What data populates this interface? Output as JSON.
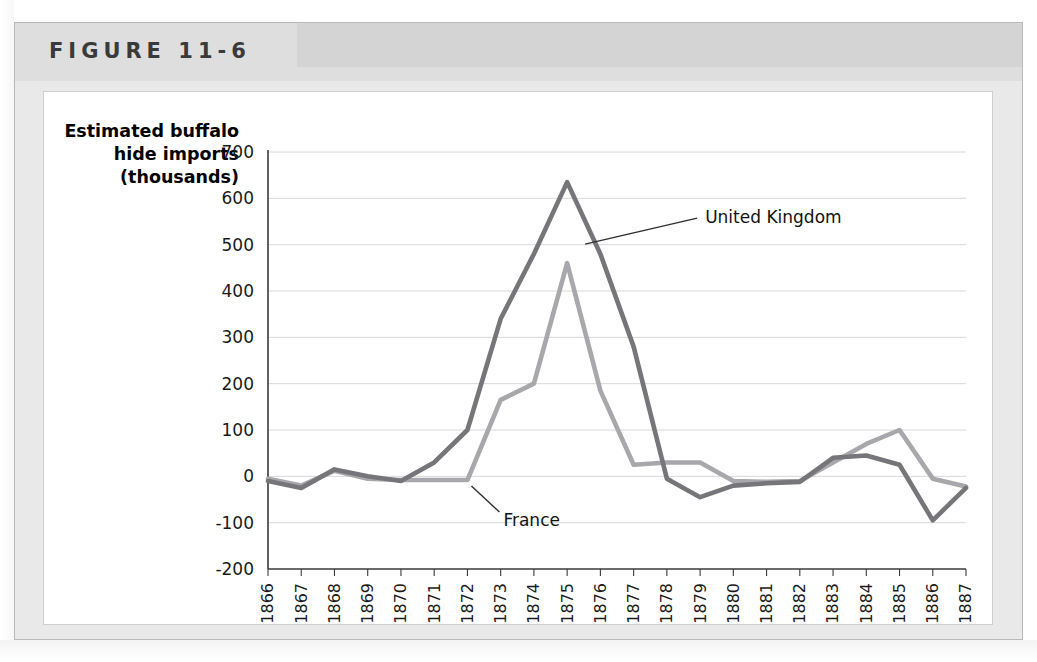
{
  "figure": {
    "label": "FIGURE 11-6"
  },
  "chart_data": {
    "type": "line",
    "title": "",
    "ylabel": "Estimated buffalo hide imports (thousands)",
    "xlabel": "",
    "ylim": [
      -200,
      700
    ],
    "ytick_values": [
      700,
      600,
      500,
      400,
      300,
      200,
      100,
      0,
      -100,
      -200
    ],
    "ytick_labels": [
      "700",
      "600",
      "500",
      "400",
      "300",
      "200",
      "100",
      "0",
      "-100",
      "-200"
    ],
    "grid": "horizontal",
    "legend_position": "inline-annotations",
    "categories": [
      "1866",
      "1867",
      "1868",
      "1869",
      "1870",
      "1871",
      "1872",
      "1873",
      "1874",
      "1875",
      "1876",
      "1877",
      "1878",
      "1879",
      "1880",
      "1881",
      "1882",
      "1883",
      "1884",
      "1885",
      "1886",
      "1887"
    ],
    "series": [
      {
        "name": "United Kingdom",
        "color": "#76767a",
        "values": [
          -10,
          -25,
          15,
          0,
          -10,
          30,
          100,
          340,
          480,
          635,
          480,
          280,
          -5,
          -45,
          -20,
          -15,
          -12,
          40,
          45,
          25,
          -95,
          -25
        ]
      },
      {
        "name": "France",
        "color": "#a8a8ac",
        "values": [
          -5,
          -20,
          12,
          -5,
          -8,
          -8,
          -8,
          165,
          200,
          460,
          185,
          25,
          30,
          30,
          -10,
          -12,
          -10,
          30,
          70,
          100,
          -5,
          -22
        ]
      }
    ],
    "annotations": [
      {
        "text": "United Kingdom",
        "series": "United Kingdom",
        "anchor_year": "1875"
      },
      {
        "text": "France",
        "series": "France",
        "anchor_year": "1872"
      }
    ]
  }
}
